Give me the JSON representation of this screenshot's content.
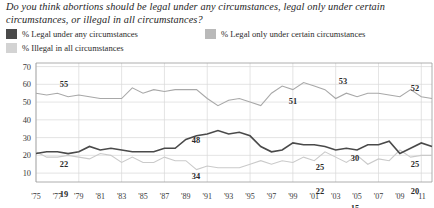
{
  "title": {
    "line1": "Do you think abortions should be legal under any circumstances, legal only",
    "line2": "under certain circumstances, or illegal in all circumstances?"
  },
  "legend": {
    "items": [
      {
        "label": "% Legal under any circumstances",
        "color": "#4a4a4a",
        "swatch": "dark"
      },
      {
        "label": "% Legal only under certain circumstances",
        "color": "#b9b9b9",
        "swatch": "mid"
      },
      {
        "label": "% Illegal in all circumstances",
        "color": "#d3d3d3",
        "swatch": "light"
      }
    ]
  },
  "axes": {
    "y_ticks": [
      "70",
      "60",
      "50",
      "40",
      "30",
      "20",
      "10"
    ],
    "x_ticks": [
      "'75",
      "'77",
      "'79",
      "'81",
      "'83",
      "'85",
      "'87",
      "'89",
      "'91",
      "'93",
      "'95",
      "'97",
      "'99",
      "'01",
      "'03",
      "'05",
      "'07",
      "'09",
      "'11"
    ]
  },
  "annotations": [
    {
      "text": "55",
      "x": 64,
      "y": 30
    },
    {
      "text": "22",
      "x": 64,
      "y": 110
    },
    {
      "text": "19",
      "x": 64,
      "y": 140
    },
    {
      "text": "48",
      "x": 196,
      "y": 86
    },
    {
      "text": "34",
      "x": 196,
      "y": 122
    },
    {
      "text": "13",
      "x": 196,
      "y": 160
    },
    {
      "text": "51",
      "x": 293,
      "y": 47
    },
    {
      "text": "53",
      "x": 343,
      "y": 27
    },
    {
      "text": "25",
      "x": 320,
      "y": 113
    },
    {
      "text": "22",
      "x": 320,
      "y": 137
    },
    {
      "text": "30",
      "x": 355,
      "y": 104
    },
    {
      "text": "15",
      "x": 355,
      "y": 154
    },
    {
      "text": "52",
      "x": 415,
      "y": 34
    },
    {
      "text": "25",
      "x": 415,
      "y": 110
    },
    {
      "text": "20",
      "x": 415,
      "y": 137
    }
  ],
  "chart_data": {
    "type": "line",
    "title": "Do you think abortions should be legal under any circumstances, legal only under certain circumstances, or illegal in all circumstances?",
    "xlabel": "",
    "ylabel": "",
    "ylim": [
      5,
      72
    ],
    "yticks": [
      10,
      20,
      30,
      40,
      50,
      60,
      70
    ],
    "grid": true,
    "legend_position": "top",
    "x": [
      1975,
      1976,
      1977,
      1978,
      1979,
      1980,
      1981,
      1982,
      1983,
      1984,
      1985,
      1986,
      1987,
      1988,
      1989,
      1990,
      1991,
      1992,
      1993,
      1994,
      1995,
      1996,
      1997,
      1998,
      1999,
      2000,
      2001,
      2002,
      2003,
      2004,
      2005,
      2006,
      2007,
      2008,
      2009,
      2010,
      2011,
      2012
    ],
    "series": [
      {
        "name": "% Legal only under certain circumstances",
        "color": "#a8a8a8",
        "values": [
          55,
          54,
          55,
          53,
          54,
          53,
          52,
          52,
          52,
          58,
          55,
          57,
          56,
          57,
          57,
          57,
          52,
          48,
          51,
          52,
          50,
          48,
          55,
          59,
          57,
          61,
          59,
          57,
          52,
          55,
          53,
          55,
          55,
          54,
          53,
          57,
          53,
          52
        ]
      },
      {
        "name": "% Legal under any circumstances",
        "color": "#4a4a4a",
        "values": [
          21,
          22,
          22,
          21,
          22,
          25,
          23,
          24,
          23,
          22,
          22,
          22,
          24,
          24,
          29,
          31,
          32,
          34,
          32,
          33,
          31,
          25,
          22,
          23,
          27,
          26,
          26,
          25,
          23,
          24,
          23,
          26,
          26,
          28,
          21,
          24,
          27,
          25
        ]
      },
      {
        "name": "% Illegal in all circumstances",
        "color": "#cacaca",
        "values": [
          22,
          19,
          19,
          20,
          19,
          18,
          21,
          20,
          16,
          19,
          16,
          16,
          19,
          17,
          17,
          12,
          14,
          13,
          13,
          13,
          15,
          17,
          15,
          17,
          16,
          19,
          17,
          22,
          19,
          16,
          20,
          15,
          18,
          17,
          23,
          19,
          20,
          20
        ]
      }
    ],
    "data_labels": [
      {
        "series": "% Legal only under certain circumstances",
        "year": 1977,
        "value": 55
      },
      {
        "series": "% Legal under any circumstances",
        "year": 1977,
        "value": 22
      },
      {
        "series": "% Illegal in all circumstances",
        "year": 1977,
        "value": 19
      },
      {
        "series": "% Legal only under certain circumstances",
        "year": 1992,
        "value": 48
      },
      {
        "series": "% Legal under any circumstances",
        "year": 1992,
        "value": 34
      },
      {
        "series": "% Illegal in all circumstances",
        "year": 1992,
        "value": 13
      },
      {
        "series": "% Legal only under certain circumstances",
        "year": 2001,
        "value": 51
      },
      {
        "series": "% Legal only under certain circumstances",
        "year": 2006,
        "value": 53
      },
      {
        "series": "% Legal under any circumstances",
        "year": 2003,
        "value": 25
      },
      {
        "series": "% Illegal in all circumstances",
        "year": 2003,
        "value": 22
      },
      {
        "series": "% Legal under any circumstances",
        "year": 2007,
        "value": 30
      },
      {
        "series": "% Illegal in all circumstances",
        "year": 2007,
        "value": 15
      },
      {
        "series": "% Legal only under certain circumstances",
        "year": 2012,
        "value": 52
      },
      {
        "series": "% Legal under any circumstances",
        "year": 2012,
        "value": 25
      },
      {
        "series": "% Illegal in all circumstances",
        "year": 2012,
        "value": 20
      }
    ]
  }
}
